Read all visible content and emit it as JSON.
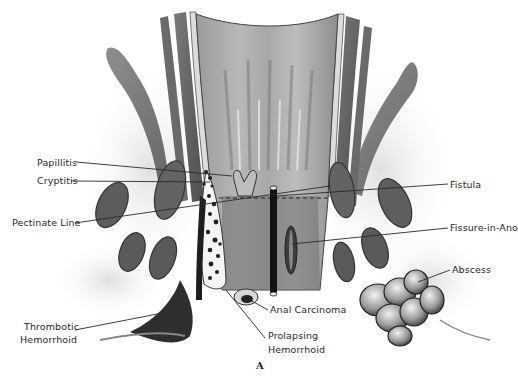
{
  "figure": {
    "type": "anatomical-illustration",
    "palette": {
      "ink": "#2a2a2a",
      "tissue_dark": "#5a5a5a",
      "tissue_mid": "#8c8c8c",
      "tissue_light": "#c8c8c8",
      "background": "#ffffff"
    },
    "caption": "A"
  },
  "labels": {
    "left": [
      {
        "id": "papillitis",
        "text": "Papillitis"
      },
      {
        "id": "cryptitis",
        "text": "Cryptitis"
      },
      {
        "id": "pectinate_line",
        "text": "Pectinate Line"
      },
      {
        "id": "thrombotic_hemorrhoid_1",
        "text": "Thrombotic"
      },
      {
        "id": "thrombotic_hemorrhoid_2",
        "text": "Hemorrhoid"
      }
    ],
    "right": [
      {
        "id": "fistula",
        "text": "Fistula"
      },
      {
        "id": "fissure_in_ano",
        "text": "Fissure-in-Ano"
      },
      {
        "id": "abscess",
        "text": "Abscess"
      }
    ],
    "bottom": [
      {
        "id": "anal_carcinoma",
        "text": "Anal Carcinoma"
      },
      {
        "id": "prolapsing_hemorrhoid_1",
        "text": "Prolapsing"
      },
      {
        "id": "prolapsing_hemorrhoid_2",
        "text": "Hemorrhoid"
      }
    ]
  }
}
